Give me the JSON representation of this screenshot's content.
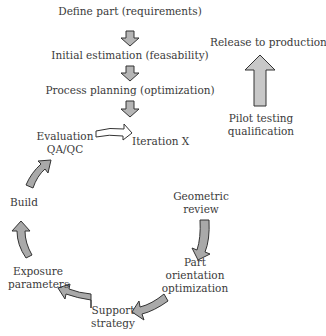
{
  "diagram": {
    "type": "process-flow",
    "linear_steps": [
      "Define part (requirements)",
      "Initial estimation (feasability)",
      "Process planning (optimization)"
    ],
    "iteration_label": "Iteration X",
    "cycle_steps": {
      "geometric_review": [
        "Geometric",
        "review"
      ],
      "part_orientation": [
        "Part",
        "orientation",
        "optimization"
      ],
      "support_strategy": [
        "Support",
        "strategy"
      ],
      "exposure_parameters": [
        "Exposure",
        "parameters"
      ],
      "build": [
        "Build"
      ],
      "evaluation": [
        "Evaluation",
        "QA/QC"
      ]
    },
    "release": {
      "top": "Release to production",
      "bottom": [
        "Pilot testing",
        "qualification"
      ]
    },
    "colors": {
      "arrow_fill": "#a9a9a9",
      "arrow_stroke": "#333333",
      "text": "#3a3a3a"
    }
  }
}
